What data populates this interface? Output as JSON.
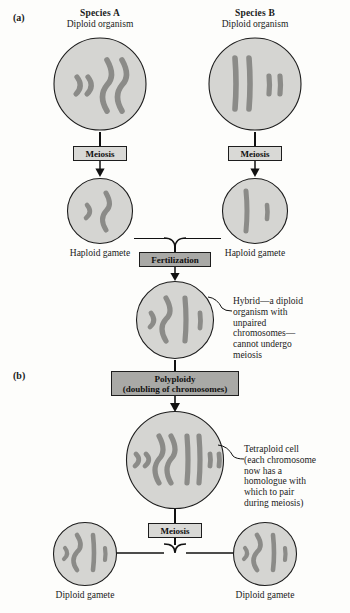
{
  "figure": {
    "panels": [
      {
        "id": "a",
        "label": "(a)"
      },
      {
        "id": "b",
        "label": "(b)"
      }
    ],
    "colors": {
      "cell_fill": "#d5d5d2",
      "cell_stroke": "#1d1d1d",
      "chromosome": "#8b8b88",
      "chromosome_stroke": "#6f6f6c",
      "box_light": "#d9d9d6",
      "box_dark": "#a9a9a6",
      "line": "#111111",
      "page_bg": "#fdfdfb"
    }
  },
  "headings": {
    "species_a": {
      "title": "Species A",
      "subtitle": "Diploid organism"
    },
    "species_b": {
      "title": "Species B",
      "subtitle": "Diploid organism"
    }
  },
  "process_boxes": {
    "meiosis_a": {
      "label": "Meiosis",
      "tone": "light"
    },
    "meiosis_b": {
      "label": "Meiosis",
      "tone": "light"
    },
    "fertilization": {
      "label": "Fertilization",
      "tone": "dark"
    },
    "polyploidy": {
      "line1": "Polyploidy",
      "line2": "(doubling of chromosomes)",
      "tone": "dark"
    },
    "meiosis_final": {
      "label": "Meiosis",
      "tone": "light"
    }
  },
  "captions": {
    "haploid_gamete_a": "Haploid gamete",
    "haploid_gamete_b": "Haploid gamete",
    "diploid_gamete_left": "Diploid gamete",
    "diploid_gamete_right": "Diploid gamete"
  },
  "annotations": {
    "hybrid": {
      "lines": [
        "Hybrid—a diploid",
        "organism with",
        "unpaired",
        "chromosomes—",
        "cannot undergo",
        "meiosis"
      ]
    },
    "tetraploid": {
      "lines": [
        "Tetraploid cell",
        "(each chromosome",
        "now has a",
        "homologue with",
        "which to pair",
        "during meiosis)"
      ]
    }
  },
  "cells": [
    {
      "name": "species-a-parent",
      "chromosome_set": "2 short curved, 2 long curved",
      "counts": {
        "short_curved": 2,
        "long_curved": 2,
        "long_straight": 0,
        "short_straight": 0
      }
    },
    {
      "name": "species-b-parent",
      "chromosome_set": "2 long straight, 2 short straight",
      "counts": {
        "short_curved": 0,
        "long_curved": 0,
        "long_straight": 2,
        "short_straight": 2
      }
    },
    {
      "name": "haploid-gamete-a",
      "chromosome_set": "1 short curved, 1 long curved",
      "counts": {
        "short_curved": 1,
        "long_curved": 1,
        "long_straight": 0,
        "short_straight": 0
      }
    },
    {
      "name": "haploid-gamete-b",
      "chromosome_set": "1 long straight, 1 short straight",
      "counts": {
        "short_curved": 0,
        "long_curved": 0,
        "long_straight": 1,
        "short_straight": 1
      }
    },
    {
      "name": "hybrid-cell",
      "chromosome_set": "1 short curved, 1 long curved, 1 long straight, 1 short straight",
      "counts": {
        "short_curved": 1,
        "long_curved": 1,
        "long_straight": 1,
        "short_straight": 1
      }
    },
    {
      "name": "tetraploid-cell",
      "chromosome_set": "2 short curved, 2 long curved, 2 long straight, 2 short straight",
      "counts": {
        "short_curved": 2,
        "long_curved": 2,
        "long_straight": 2,
        "short_straight": 2
      }
    },
    {
      "name": "diploid-gamete-left",
      "chromosome_set": "1 short curved, 1 long curved, 1 long straight, 1 short straight",
      "counts": {
        "short_curved": 1,
        "long_curved": 1,
        "long_straight": 1,
        "short_straight": 1
      }
    },
    {
      "name": "diploid-gamete-right",
      "chromosome_set": "1 short curved, 1 long curved, 1 long straight, 1 short straight",
      "counts": {
        "short_curved": 1,
        "long_curved": 1,
        "long_straight": 1,
        "short_straight": 1
      }
    }
  ]
}
